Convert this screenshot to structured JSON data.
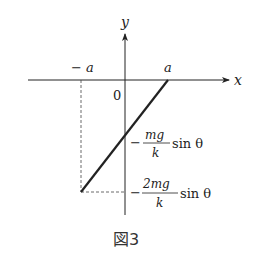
{
  "figure": {
    "caption": "図3",
    "axes": {
      "x_label": "x",
      "y_label": "y",
      "origin_label": "0"
    },
    "ticks": {
      "neg_a": "− a",
      "pos_a": "a"
    },
    "y_annotations": [
      {
        "sign": "−",
        "numerator": "mg",
        "denominator": "k",
        "suffix": "sin θ"
      },
      {
        "sign": "−",
        "numerator": "2mg",
        "denominator": "k",
        "suffix": "sin θ"
      }
    ],
    "line": {
      "description": "straight line from (-a, -2mg/k sin θ) to (a, 0)",
      "points": [
        {
          "x": "-a",
          "y": "-2mg/k sin θ"
        },
        {
          "x": "0",
          "y": "-mg/k sin θ"
        },
        {
          "x": "a",
          "y": "0"
        }
      ]
    }
  }
}
